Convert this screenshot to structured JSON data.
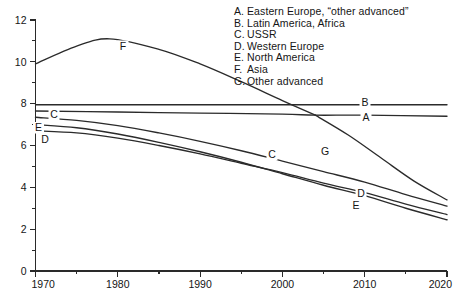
{
  "legend": {
    "entries": [
      {
        "key": "A.",
        "label": "Eastern Europe, “other advanced”"
      },
      {
        "key": "B.",
        "label": "Latin America, Africa"
      },
      {
        "key": "C.",
        "label": "USSR"
      },
      {
        "key": "D.",
        "label": "Western Europe"
      },
      {
        "key": "E.",
        "label": "North America"
      },
      {
        "key": "F.",
        "label": "Asia"
      },
      {
        "key": "G.",
        "label": "Other advanced"
      }
    ]
  },
  "axes": {
    "y_ticks": [
      "0",
      "2",
      "4",
      "6",
      "8",
      "10",
      "12"
    ],
    "x_ticks": [
      "1970",
      "1980",
      "1990",
      "2000",
      "2010",
      "2020"
    ]
  },
  "curve_labels": {
    "F": "F",
    "B": "B",
    "A": "A",
    "C_left": "C",
    "E_left": "E",
    "D_left": "D",
    "C_mid": "C",
    "G_mid": "G",
    "D_right": "D",
    "E_right": "E"
  },
  "colors": {
    "ink": "#2a2a2a",
    "background": "#ffffff"
  },
  "chart_data": {
    "type": "line",
    "title": "",
    "xlabel": "",
    "ylabel": "",
    "xlim": [
      1970,
      2020
    ],
    "ylim": [
      0,
      12
    ],
    "x_ticks": [
      1970,
      1980,
      1990,
      2000,
      2010,
      2020
    ],
    "y_ticks": [
      0,
      2,
      4,
      6,
      8,
      10,
      12
    ],
    "x_minor_step": 5,
    "y_minor_step": 1,
    "grid": false,
    "legend_position": "top-right",
    "series": [
      {
        "name": "A",
        "legend_label": "Eastern Europe, “other advanced”",
        "x": [
          1970,
          1980,
          1990,
          2000,
          2004,
          2010,
          2020
        ],
        "values": [
          7.65,
          7.6,
          7.55,
          7.5,
          7.45,
          7.45,
          7.4
        ]
      },
      {
        "name": "B",
        "legend_label": "Latin America, Africa",
        "x": [
          1970,
          1980,
          1990,
          2000,
          2010,
          2020
        ],
        "values": [
          7.95,
          7.95,
          7.95,
          7.95,
          7.95,
          7.95
        ]
      },
      {
        "name": "C",
        "legend_label": "USSR",
        "x": [
          1970,
          1975,
          1980,
          1985,
          1990,
          1995,
          2000,
          2005,
          2010,
          2015,
          2020
        ],
        "values": [
          7.35,
          7.2,
          6.95,
          6.6,
          6.2,
          5.75,
          5.25,
          4.75,
          4.25,
          3.65,
          3.1
        ]
      },
      {
        "name": "D",
        "legend_label": "Western Europe",
        "x": [
          1970,
          1975,
          1980,
          1985,
          1990,
          1995,
          2000,
          2005,
          2010,
          2015,
          2020
        ],
        "values": [
          6.7,
          6.6,
          6.35,
          6.0,
          5.6,
          5.15,
          4.7,
          4.2,
          3.75,
          3.2,
          2.7
        ]
      },
      {
        "name": "E",
        "legend_label": "North America",
        "x": [
          1970,
          1975,
          1980,
          1985,
          1990,
          1995,
          2000,
          2005,
          2010,
          2015,
          2020
        ],
        "values": [
          7.0,
          6.85,
          6.55,
          6.15,
          5.7,
          5.2,
          4.65,
          4.1,
          3.6,
          3.0,
          2.45
        ]
      },
      {
        "name": "F",
        "legend_label": "Asia",
        "x": [
          1970,
          1975,
          1979,
          1985,
          1990,
          1995,
          2000,
          2004
        ],
        "values": [
          9.9,
          10.75,
          11.1,
          10.6,
          9.9,
          9.05,
          8.15,
          7.45
        ]
      },
      {
        "name": "G",
        "legend_label": "Other advanced",
        "x": [
          2004,
          2008,
          2012,
          2016,
          2020
        ],
        "values": [
          7.45,
          6.5,
          5.4,
          4.3,
          3.4
        ]
      }
    ]
  }
}
